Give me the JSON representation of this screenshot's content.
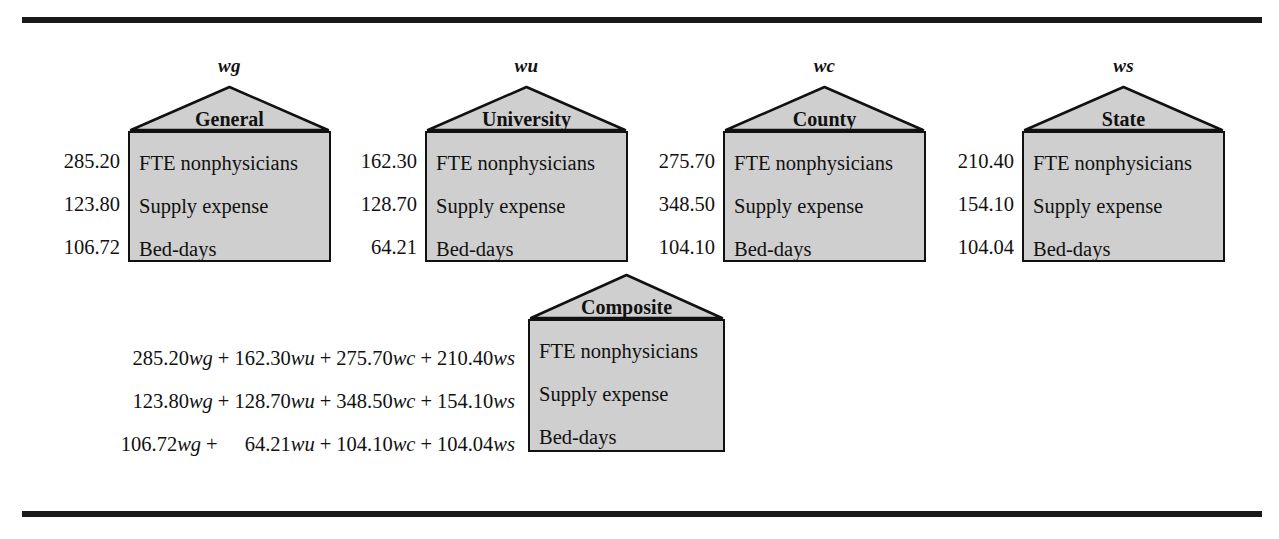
{
  "figure": {
    "type": "composite-index-diagram",
    "rule_color": "#1a1a1a",
    "house_fill": "#cfcfcf",
    "house_stroke": "#111111"
  },
  "attribute_labels": {
    "fte": "FTE nonphysicians",
    "supply": "Supply expense",
    "beddays": "Bed-days"
  },
  "houses": [
    {
      "weight": "wg",
      "title": "General",
      "values": {
        "fte": "285.20",
        "supply": "123.80",
        "beddays": "106.72"
      }
    },
    {
      "weight": "wu",
      "title": "University",
      "values": {
        "fte": "162.30",
        "supply": "128.70",
        "beddays": "64.21"
      }
    },
    {
      "weight": "wc",
      "title": "County",
      "values": {
        "fte": "275.70",
        "supply": "348.50",
        "beddays": "104.10"
      }
    },
    {
      "weight": "ws",
      "title": "State",
      "values": {
        "fte": "210.40",
        "supply": "154.10",
        "beddays": "104.04"
      }
    }
  ],
  "composite": {
    "title": "Composite",
    "attributes": {
      "fte": "FTE nonphysicians",
      "supply": "Supply expense",
      "beddays": "Bed-days"
    },
    "equations": [
      {
        "for": "FTE nonphysicians",
        "text": "285.20wg + 162.30wu + 275.70wc + 210.40ws",
        "terms": [
          {
            "coef": "285.20",
            "weight": "wg"
          },
          {
            "coef": "162.30",
            "weight": "wu"
          },
          {
            "coef": "275.70",
            "weight": "wc"
          },
          {
            "coef": "210.40",
            "weight": "ws"
          }
        ]
      },
      {
        "for": "Supply expense",
        "text": "123.80wg + 128.70wu + 348.50wc + 154.10ws",
        "terms": [
          {
            "coef": "123.80",
            "weight": "wg"
          },
          {
            "coef": "128.70",
            "weight": "wu"
          },
          {
            "coef": "348.50",
            "weight": "wc"
          },
          {
            "coef": "154.10",
            "weight": "ws"
          }
        ]
      },
      {
        "for": "Bed-days",
        "text": "106.72wg +  64.21wu + 104.10wc + 104.04ws",
        "terms": [
          {
            "coef": "106.72",
            "weight": "wg"
          },
          {
            "coef": "64.21",
            "weight": "wu"
          },
          {
            "coef": "104.10",
            "weight": "wc"
          },
          {
            "coef": "104.04",
            "weight": "ws"
          }
        ]
      }
    ],
    "operator": "+"
  }
}
